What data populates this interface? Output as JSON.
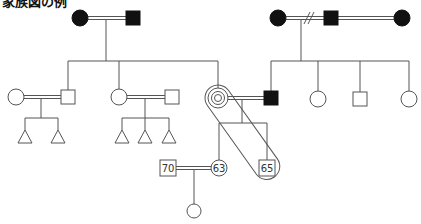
{
  "title": "家族図の例",
  "colors": {
    "line": "#555555",
    "filled": "#111111",
    "background": "#ffffff"
  },
  "legend_semantics": {
    "square": "male",
    "circle": "female",
    "triangle": "child (gender unspecified)",
    "filled": "deceased",
    "concentric_circle": "identified patient (female)",
    "double_line": "marriage",
    "slash_marks": "divorce",
    "enclosure": "household / cohabiting group"
  },
  "people": {
    "gp_left_female": {
      "shape": "circle",
      "filled": true
    },
    "gp_left_male": {
      "shape": "square",
      "filled": true
    },
    "gp_right_female1": {
      "shape": "circle",
      "filled": true
    },
    "gp_right_male": {
      "shape": "square",
      "filled": true
    },
    "gp_right_female2": {
      "shape": "circle",
      "filled": true
    },
    "sib1_spouse": {
      "shape": "circle",
      "filled": false
    },
    "sib1": {
      "shape": "square",
      "filled": false
    },
    "sib2": {
      "shape": "circle",
      "filled": false
    },
    "sib2_spouse": {
      "shape": "square",
      "filled": false
    },
    "patient": {
      "shape": "concentric-circle",
      "filled": false
    },
    "patient_spouse": {
      "shape": "square",
      "filled": true
    },
    "rsib1": {
      "shape": "circle",
      "filled": false
    },
    "rsib2": {
      "shape": "square",
      "filled": false
    },
    "rsib3": {
      "shape": "circle",
      "filled": false
    },
    "child_female": {
      "shape": "circle",
      "filled": false,
      "age": "63"
    },
    "child_male": {
      "shape": "square",
      "filled": false,
      "age": "65"
    },
    "child_female_spouse": {
      "shape": "square",
      "filled": false,
      "age": "70"
    },
    "grandchild": {
      "shape": "circle",
      "filled": false
    }
  },
  "labels": {
    "age_70": "70",
    "age_63": "63",
    "age_65": "65"
  },
  "relationships": [
    {
      "type": "marriage",
      "a": "gp_left_female",
      "b": "gp_left_male"
    },
    {
      "type": "divorce",
      "a": "gp_right_female1",
      "b": "gp_right_male"
    },
    {
      "type": "marriage",
      "a": "gp_right_male",
      "b": "gp_right_female2"
    },
    {
      "type": "marriage",
      "a": "sib1_spouse",
      "b": "sib1",
      "children": 2
    },
    {
      "type": "marriage",
      "a": "sib2",
      "b": "sib2_spouse",
      "children": 3
    },
    {
      "type": "marriage",
      "a": "patient",
      "b": "patient_spouse"
    },
    {
      "type": "marriage",
      "a": "child_female_spouse",
      "b": "child_female",
      "children": 1
    }
  ]
}
